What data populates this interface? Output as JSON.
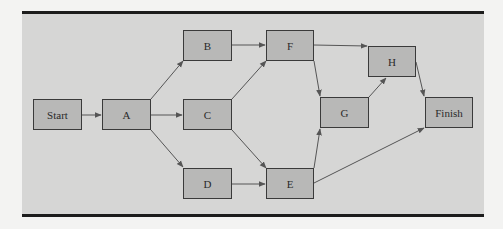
{
  "diagram": {
    "type": "network-activity-diagram",
    "colors": {
      "panel": "#d6d6d5",
      "node_fill": "#b8b8b7",
      "node_border": "#3a3a3a",
      "edge": "#555555",
      "rule": "#1c1c1c",
      "page": "#f3f3f2"
    },
    "nodes": [
      {
        "id": "start",
        "label": "Start",
        "x": 33,
        "y": 99,
        "w": 49,
        "h": 31
      },
      {
        "id": "a",
        "label": "A",
        "x": 102,
        "y": 99,
        "w": 49,
        "h": 31
      },
      {
        "id": "b",
        "label": "B",
        "x": 183,
        "y": 30,
        "w": 49,
        "h": 31
      },
      {
        "id": "c",
        "label": "C",
        "x": 183,
        "y": 99,
        "w": 49,
        "h": 31
      },
      {
        "id": "d",
        "label": "D",
        "x": 183,
        "y": 168,
        "w": 49,
        "h": 31
      },
      {
        "id": "f",
        "label": "F",
        "x": 266,
        "y": 30,
        "w": 48,
        "h": 31
      },
      {
        "id": "e",
        "label": "E",
        "x": 266,
        "y": 168,
        "w": 48,
        "h": 31
      },
      {
        "id": "g",
        "label": "G",
        "x": 320,
        "y": 97,
        "w": 49,
        "h": 31
      },
      {
        "id": "h",
        "label": "H",
        "x": 368,
        "y": 46,
        "w": 48,
        "h": 31
      },
      {
        "id": "finish",
        "label": "Finish",
        "x": 425,
        "y": 97,
        "w": 48,
        "h": 31
      }
    ],
    "edges": [
      {
        "from": "Start",
        "to": "A"
      },
      {
        "from": "A",
        "to": "B"
      },
      {
        "from": "A",
        "to": "C"
      },
      {
        "from": "A",
        "to": "D"
      },
      {
        "from": "B",
        "to": "F"
      },
      {
        "from": "C",
        "to": "F"
      },
      {
        "from": "C",
        "to": "E"
      },
      {
        "from": "D",
        "to": "E"
      },
      {
        "from": "F",
        "to": "H"
      },
      {
        "from": "F",
        "to": "G"
      },
      {
        "from": "E",
        "to": "G"
      },
      {
        "from": "E",
        "to": "Finish"
      },
      {
        "from": "G",
        "to": "H"
      },
      {
        "from": "H",
        "to": "Finish"
      }
    ]
  }
}
